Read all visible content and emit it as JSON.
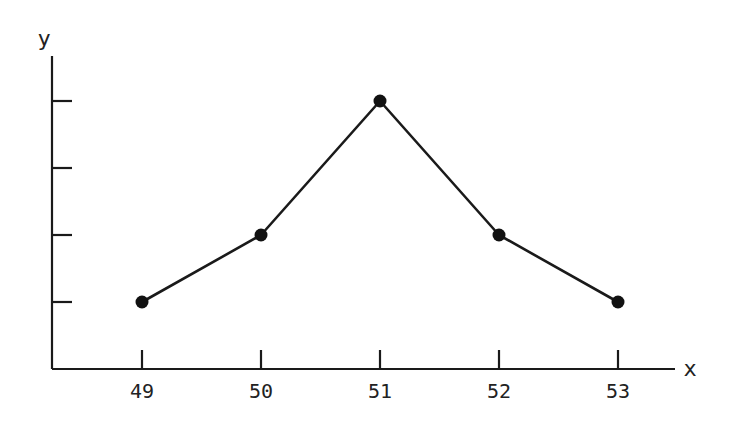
{
  "chart_data": {
    "type": "line",
    "title": "",
    "xlabel": "x",
    "ylabel": "y",
    "x": [
      49,
      50,
      51,
      52,
      53
    ],
    "categories": [
      "49",
      "50",
      "51",
      "52",
      "53"
    ],
    "series": [
      {
        "name": "y",
        "values": [
          1,
          2,
          4,
          2,
          1
        ]
      }
    ],
    "xlim": [
      48.25,
      53.45
    ],
    "ylim": [
      0,
      4.5
    ],
    "y_ticks": [
      1,
      2,
      3,
      4
    ],
    "y_tick_labels_shown": false,
    "grid": false,
    "legend": "none",
    "markers": "filled-circle",
    "line_color": "#1a1a1a"
  }
}
